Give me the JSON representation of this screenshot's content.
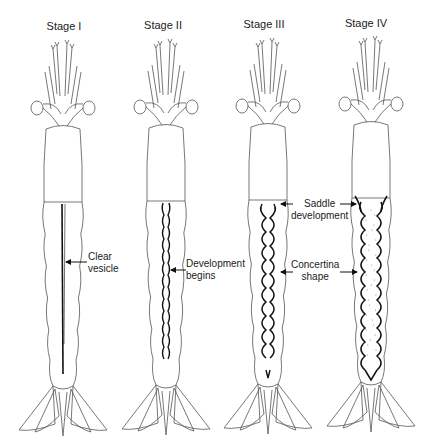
{
  "figure": {
    "stages": [
      {
        "title": "Stage I",
        "vesicle": "straight"
      },
      {
        "title": "Stage II",
        "vesicle": "wavy"
      },
      {
        "title": "Stage III",
        "vesicle": "concertina"
      },
      {
        "title": "Stage IV",
        "vesicle": "full"
      }
    ],
    "annotations": {
      "clear_vesicle": {
        "line1": "Clear",
        "line2": "vesicle"
      },
      "development_begins": {
        "line1": "Development",
        "line2": "begins"
      },
      "saddle_development": {
        "line1": "Saddle",
        "line2": "development"
      },
      "concertina_shape": {
        "line1": "Concertina",
        "line2": "shape"
      }
    },
    "colors": {
      "line": "#555555",
      "vesicle": "#111111",
      "stipple": "#888888"
    }
  }
}
